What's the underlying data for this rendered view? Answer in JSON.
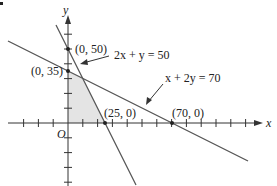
{
  "diagram": {
    "type": "linear-programming-feasible-region",
    "axes": {
      "x_label": "x",
      "y_label": "y",
      "origin_label": "O",
      "tick_spacing_units": 10
    },
    "lines": [
      {
        "equation": "2x + y = 50",
        "x_intercept": 25,
        "y_intercept": 50
      },
      {
        "equation": "x + 2y = 70",
        "x_intercept": 70,
        "y_intercept": 35
      }
    ],
    "points": [
      {
        "label": "(0, 50)",
        "x": 0,
        "y": 50
      },
      {
        "label": "(0, 35)",
        "x": 0,
        "y": 35
      },
      {
        "label": "(25, 0)",
        "x": 25,
        "y": 0
      },
      {
        "label": "(70, 0)",
        "x": 70,
        "y": 0
      }
    ],
    "feasible_region": {
      "vertices": [
        [
          0,
          0
        ],
        [
          0,
          35
        ],
        [
          10,
          30
        ],
        [
          25,
          0
        ]
      ],
      "fill": "#e4e4e4"
    },
    "colors": {
      "line": "#555555",
      "axis": "#333333",
      "shade": "#e4e4e4"
    }
  }
}
